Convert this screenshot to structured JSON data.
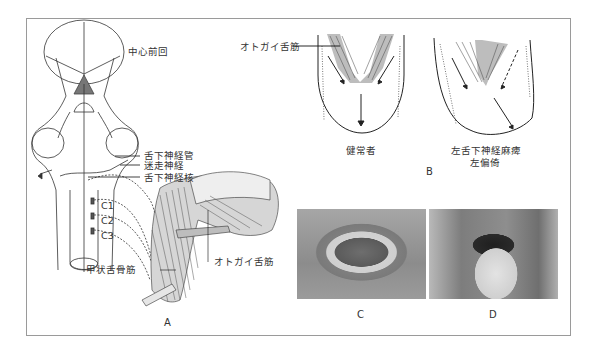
{
  "figure": {
    "panels": {
      "A": {
        "letter": "A",
        "labels": {
          "precentral_gyrus": "中心前回",
          "hypoglossal_canal": "舌下神経管",
          "vagus_nerve": "迷走神経",
          "hypoglossal_nucleus": "舌下神経核",
          "c1": "C1",
          "c2": "C2",
          "c3": "C3",
          "thyrohyoid_muscle": "甲状舌骨筋",
          "genioglossus_muscle": "オトガイ舌筋"
        }
      },
      "B": {
        "letter": "B",
        "labels": {
          "genioglossus_muscle": "オトガイ舌筋",
          "normal": "健常者",
          "left_palsy_line1": "左舌下神経麻痺",
          "left_palsy_line2": "左偏倚"
        }
      },
      "C": {
        "letter": "C"
      },
      "D": {
        "letter": "D"
      }
    },
    "colors": {
      "frame": "#9a9a9a",
      "muscle_fill": "#bdbdbd",
      "line": "#222222"
    }
  }
}
